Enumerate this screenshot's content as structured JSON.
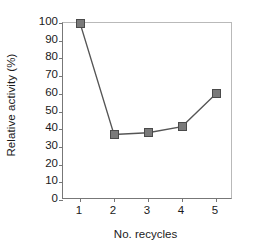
{
  "chart_data": {
    "type": "line",
    "title": "",
    "xlabel": "No. recycles",
    "ylabel": "Relative activity (%)",
    "categories": [
      1,
      2,
      3,
      4,
      5
    ],
    "x": [
      1,
      2,
      3,
      4,
      5
    ],
    "values": [
      100,
      37,
      38,
      41.5,
      60
    ],
    "series": [
      {
        "name": "Relative activity",
        "values": [
          100,
          37,
          38,
          41.5,
          60
        ]
      }
    ],
    "xtick_labels": [
      "1",
      "2",
      "3",
      "4",
      "5"
    ],
    "ytick_labels": [
      "0",
      "10",
      "20",
      "30",
      "40",
      "50",
      "60",
      "70",
      "80",
      "90",
      "100"
    ],
    "ytick_values": [
      0,
      10,
      20,
      30,
      40,
      50,
      60,
      70,
      80,
      90,
      100
    ],
    "ylim": [
      0,
      100
    ],
    "xlim": [
      0.5,
      5.5
    ],
    "grid": false,
    "legend": false,
    "marker": "square",
    "marker_color": "#7a7a7a",
    "marker_edge_color": "#4a4a4a",
    "line_color": "#555555",
    "axis_color": "#777777",
    "frame_color": "#b9b9b9",
    "background": "#ffffff"
  }
}
